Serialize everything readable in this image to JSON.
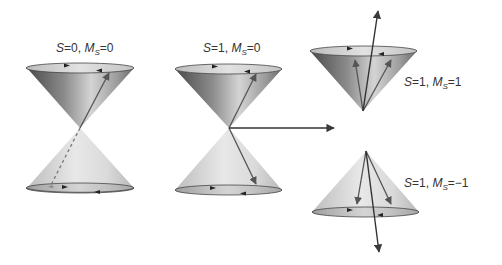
{
  "diagram": {
    "type": "spin-vector-cones",
    "colors": {
      "cone_dark": "#5a5a5a",
      "cone_mid": "#a8a8a8",
      "cone_light": "#e6e6e6",
      "arrow": "#3a3a3a",
      "text": "#333333"
    },
    "panels": [
      {
        "id": "singlet",
        "label": {
          "S": "S",
          "eq1": "=0, ",
          "M": "M",
          "sub": "S",
          "eq2": "=0"
        },
        "full_label": "S=0, MS=0"
      },
      {
        "id": "triplet-0",
        "label": {
          "S": "S",
          "eq1": "=1, ",
          "M": "M",
          "sub": "S",
          "eq2": "=0"
        },
        "full_label": "S=1, MS=0"
      },
      {
        "id": "triplet-plus1",
        "label": {
          "S": "S",
          "eq1": "=1, ",
          "M": "M",
          "sub": "S",
          "eq2": "=1"
        },
        "full_label": "S=1, MS=1"
      },
      {
        "id": "triplet-minus1",
        "label": {
          "S": "S",
          "eq1": "=1, ",
          "M": "M",
          "sub": "S",
          "eq2": "=−1"
        },
        "full_label": "S=1, MS=−1"
      }
    ]
  }
}
